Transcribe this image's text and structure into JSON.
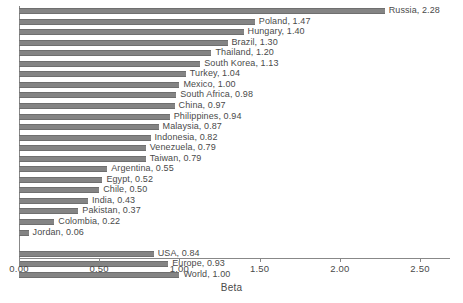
{
  "chart_data": {
    "type": "bar",
    "orientation": "horizontal",
    "title": "",
    "xlabel": "Beta",
    "ylabel": "",
    "xlim": [
      0.0,
      2.7
    ],
    "grid": false,
    "legend": null,
    "tick_labels": [
      "0.00",
      "0.50",
      "1.00",
      "1.50",
      "2.00",
      "2.50"
    ],
    "ticks": [
      0.0,
      0.5,
      1.0,
      1.5,
      2.0,
      2.5
    ],
    "bar_color": "#848484",
    "categories": [
      "Russia",
      "Poland",
      "Hungary",
      "Brazil",
      "Thailand",
      "South Korea",
      "Turkey",
      "Mexico",
      "South Africa",
      "China",
      "Philippines",
      "Malaysia",
      "Indonesia",
      "Venezuela",
      "Taiwan",
      "Argentina",
      "Egypt",
      "Chile",
      "India",
      "Pakistan",
      "Colombia",
      "Jordan",
      "USA",
      "Europe",
      "World"
    ],
    "values": [
      2.28,
      1.47,
      1.4,
      1.3,
      1.2,
      1.13,
      1.04,
      1.0,
      0.98,
      0.97,
      0.94,
      0.87,
      0.82,
      0.79,
      0.79,
      0.55,
      0.52,
      0.5,
      0.43,
      0.37,
      0.22,
      0.06,
      0.84,
      0.93,
      1.0
    ],
    "point_labels": [
      "Russia, 2.28",
      "Poland, 1.47",
      "Hungary, 1.40",
      "Brazil, 1.30",
      "Thailand, 1.20",
      "South Korea, 1.13",
      "Turkey, 1.04",
      "Mexico, 1.00",
      "South Africa, 0.98",
      "China, 0.97",
      "Philippines, 0.94",
      "Malaysia, 0.87",
      "Indonesia, 0.82",
      "Venezuela, 0.79",
      "Taiwan, 0.79",
      "Argentina, 0.55",
      "Egypt, 0.52",
      "Chile, 0.50",
      "India, 0.43",
      "Pakistan, 0.37",
      "Colombia, 0.22",
      "Jordan, 0.06",
      "USA, 0.84",
      "Europe, 0.93",
      "World, 1.00"
    ],
    "group_break_after_index": 21
  }
}
